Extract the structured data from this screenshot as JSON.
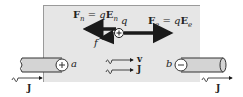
{
  "diagram": {
    "region": {
      "fill": "#e6e6e6",
      "border": "#9a9a9a"
    },
    "charge": {
      "label": "q",
      "sign": "+"
    },
    "forces": {
      "nonelectrostatic": {
        "label_F": "F",
        "label_sub": "n",
        "eq": " = q",
        "label_E": "E",
        "E_sub": "n",
        "direction": "left"
      },
      "electrostatic": {
        "label_F": "F",
        "label_sub": "e",
        "eq": " = q",
        "label_E": "E",
        "E_sub": "e",
        "direction": "right"
      },
      "friction": {
        "label": "f",
        "direction": "left"
      }
    },
    "flow_arrows": [
      {
        "label": "v"
      },
      {
        "label": "J"
      }
    ],
    "terminals": [
      {
        "name": "a",
        "sign": "+",
        "side": "left"
      },
      {
        "name": "b",
        "sign": "−",
        "side": "right"
      }
    ],
    "current_labels": [
      {
        "label": "J",
        "side": "left"
      },
      {
        "label": "J",
        "side": "right"
      }
    ],
    "colors": {
      "arrow": "#1a1a1a",
      "wire_fill": "#d4d4d4",
      "wire_stroke": "#333333"
    }
  }
}
